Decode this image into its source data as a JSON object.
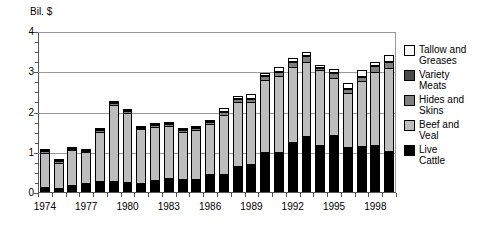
{
  "chart_data": {
    "type": "bar",
    "stacked": true,
    "title": "",
    "subtitle": "",
    "xlabel": "",
    "ylabel": "Bil. $",
    "ylim": [
      0,
      4
    ],
    "ytick_labels": [
      "0",
      "1",
      "2",
      "3",
      "4"
    ],
    "ytick_values": [
      0,
      1,
      2,
      3,
      4
    ],
    "yminor_step": 0.25,
    "grid": "horizontal",
    "legend_position": "right",
    "categories": [
      "1974",
      "1975",
      "1976",
      "1977",
      "1978",
      "1979",
      "1980",
      "1981",
      "1982",
      "1983",
      "1984",
      "1985",
      "1986",
      "1987",
      "1988",
      "1989",
      "1990",
      "1991",
      "1992",
      "1993",
      "1994",
      "1995",
      "1996",
      "1997",
      "1998",
      "1999"
    ],
    "xtick_labels_shown": [
      "1974",
      "1977",
      "1980",
      "1983",
      "1986",
      "1989",
      "1992",
      "1995",
      "1998"
    ],
    "series": [
      {
        "name": "Live Cattle",
        "color": "#000000",
        "values": [
          0.12,
          0.11,
          0.18,
          0.22,
          0.28,
          0.28,
          0.25,
          0.22,
          0.31,
          0.34,
          0.33,
          0.33,
          0.46,
          0.46,
          0.64,
          0.7,
          1.0,
          1.0,
          1.25,
          1.38,
          1.16,
          1.42,
          1.13,
          1.14,
          1.17,
          1.02
        ]
      },
      {
        "name": "Beef and Veal",
        "color": "#bdbdbd",
        "values": [
          0.86,
          0.62,
          0.86,
          0.78,
          1.22,
          1.88,
          1.71,
          1.35,
          1.31,
          1.29,
          1.16,
          1.22,
          1.22,
          1.46,
          1.6,
          1.54,
          1.78,
          1.87,
          1.86,
          1.86,
          1.86,
          1.41,
          1.32,
          1.62,
          1.8,
          2.07
        ]
      },
      {
        "name": "Hides and Skins",
        "color": "#808080",
        "values": [
          0.03,
          0.03,
          0.03,
          0.03,
          0.04,
          0.05,
          0.05,
          0.03,
          0.05,
          0.06,
          0.05,
          0.05,
          0.07,
          0.08,
          0.07,
          0.08,
          0.11,
          0.12,
          0.13,
          0.14,
          0.07,
          0.12,
          0.1,
          0.09,
          0.16,
          0.14
        ]
      },
      {
        "name": "Variety Meats",
        "color": "#4a4a4a",
        "values": [
          0.01,
          0.01,
          0.01,
          0.01,
          0.01,
          0.02,
          0.02,
          0.01,
          0.01,
          0.01,
          0.01,
          0.01,
          0.01,
          0.01,
          0.01,
          0.01,
          0.02,
          0.02,
          0.02,
          0.02,
          0.01,
          0.02,
          0.02,
          0.02,
          0.03,
          0.03
        ]
      },
      {
        "name": "Tallow and Greases",
        "color": "#ffffff",
        "values": [
          0.01,
          0.01,
          0.01,
          0.01,
          0.01,
          0.02,
          0.02,
          0.02,
          0.02,
          0.02,
          0.02,
          0.02,
          0.02,
          0.07,
          0.05,
          0.1,
          0.05,
          0.08,
          0.06,
          0.07,
          0.05,
          0.07,
          0.13,
          0.15,
          0.07,
          0.14
        ]
      }
    ],
    "totals": [
      1.03,
      0.78,
      1.09,
      1.05,
      1.56,
      2.25,
      2.05,
      1.63,
      1.7,
      1.72,
      1.57,
      1.63,
      1.78,
      2.08,
      2.37,
      2.43,
      2.96,
      3.09,
      3.32,
      3.47,
      3.15,
      3.04,
      2.7,
      3.02,
      3.23,
      3.4
    ],
    "legend": [
      {
        "label": "Tallow and\nGreases",
        "color": "#ffffff"
      },
      {
        "label": "Variety\nMeats",
        "color": "#4a4a4a"
      },
      {
        "label": "Hides and\nSkins",
        "color": "#808080"
      },
      {
        "label": "Beef and\nVeal",
        "color": "#bdbdbd"
      },
      {
        "label": "Live\nCattle",
        "color": "#000000"
      }
    ]
  }
}
